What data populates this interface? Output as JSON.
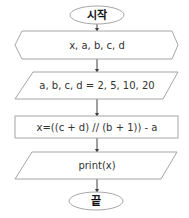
{
  "flowchart": {
    "nodes": [
      {
        "id": "start",
        "type": "terminator",
        "label": "시작"
      },
      {
        "id": "declare",
        "type": "preparation",
        "label": "x, a, b, c, d"
      },
      {
        "id": "input",
        "type": "input-output",
        "label": "a, b, c, d = 2, 5, 10, 20"
      },
      {
        "id": "process",
        "type": "process",
        "label": "x=((c + d) // (b + 1)) - a"
      },
      {
        "id": "output",
        "type": "input-output",
        "label": "print(x)"
      },
      {
        "id": "end",
        "type": "terminator",
        "label": "끝"
      }
    ],
    "edges": [
      {
        "from": "start",
        "to": "declare"
      },
      {
        "from": "declare",
        "to": "input"
      },
      {
        "from": "input",
        "to": "process"
      },
      {
        "from": "process",
        "to": "output"
      },
      {
        "from": "output",
        "to": "end"
      }
    ]
  },
  "colors": {
    "shape_border": "#a6a6a6",
    "connector": "#404040",
    "text": "#333333"
  }
}
